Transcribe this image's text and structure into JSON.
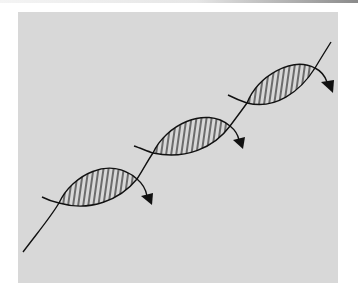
{
  "figure": {
    "turns": [
      {
        "name": "turn-1",
        "hatched": true,
        "arrow": true
      },
      {
        "name": "turn-2",
        "hatched": true,
        "arrow": true
      },
      {
        "name": "turn-3",
        "hatched": true,
        "arrow": true
      }
    ],
    "colors": {
      "background": "#ffffff",
      "panel": "#d8d8d8",
      "stroke": "#111111",
      "hatch": "#111111"
    }
  }
}
